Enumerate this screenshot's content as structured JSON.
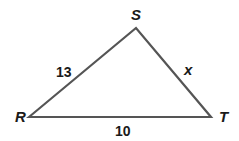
{
  "diagram": {
    "type": "triangle",
    "vertices": [
      {
        "name": "R",
        "x": 29,
        "y": 117,
        "label_x": 15,
        "label_y": 122
      },
      {
        "name": "S",
        "x": 136,
        "y": 28,
        "label_x": 131,
        "label_y": 20
      },
      {
        "name": "T",
        "x": 211,
        "y": 117,
        "label_x": 219,
        "label_y": 122
      }
    ],
    "sides": [
      {
        "from": "R",
        "to": "S",
        "label": "13",
        "label_x": 56,
        "label_y": 77
      },
      {
        "from": "S",
        "to": "T",
        "label": "x",
        "label_x": 184,
        "label_y": 75
      },
      {
        "from": "R",
        "to": "T",
        "label": "10",
        "label_x": 115,
        "label_y": 136
      }
    ],
    "stroke_color": "#555555",
    "text_color": "#1a1a1a"
  }
}
